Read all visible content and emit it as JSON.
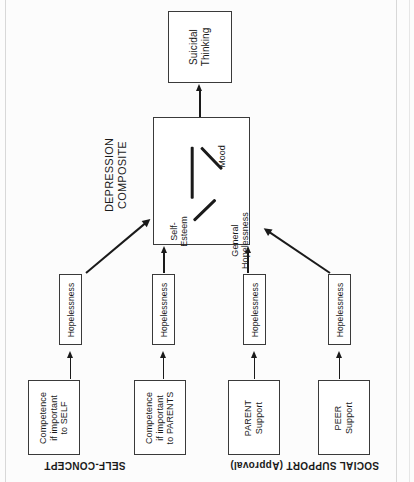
{
  "figure": {
    "orientation": "rotated-90-ccw",
    "top_node": {
      "label": "Suicidal\nThinking"
    },
    "composite": {
      "caption": "DEPRESSION\nCOMPOSITE",
      "nodes": [
        {
          "name": "mood",
          "label": "Mood"
        },
        {
          "name": "self-esteem",
          "label": "Self-\nEsteem"
        },
        {
          "name": "general-hopelessness",
          "label": "General\nHopelessness"
        }
      ]
    },
    "mediators": [
      {
        "name": "hopelessness-1",
        "label": "Hopelessness"
      },
      {
        "name": "hopelessness-2",
        "label": "Hopelessness"
      },
      {
        "name": "hopelessness-3",
        "label": "Hopelessness"
      },
      {
        "name": "hopelessness-4",
        "label": "Hopelessness"
      }
    ],
    "predictors": [
      {
        "name": "competence-self",
        "label": "Competence\nif important\nto SELF"
      },
      {
        "name": "competence-parents",
        "label": "Competence\nif important\nto PARENTS"
      },
      {
        "name": "parent-support",
        "label": "PARENT\nSupport"
      },
      {
        "name": "peer-support",
        "label": "PEER\nSupport"
      }
    ],
    "section_captions": [
      {
        "name": "self-concept",
        "label": "SELF-CONCEPT"
      },
      {
        "name": "social-support",
        "label": "SOCIAL SUPPORT (Approval)"
      }
    ],
    "colors": {
      "ink": "#1a1a1a",
      "box_border": "#3a3a3a",
      "page": "#fcfcfc",
      "scan_edge": "#d8d8d8"
    }
  }
}
